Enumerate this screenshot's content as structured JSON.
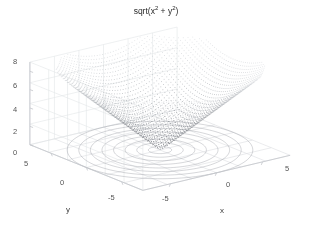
{
  "figure": {
    "width": 312,
    "height": 230,
    "background": "#ffffff",
    "title_plain": "sqrt(x^2 + y^2)"
  },
  "title": {
    "prefix": "sqrt(x",
    "sup1": "2",
    "middle": " + y",
    "sup2": "2",
    "suffix": ")"
  },
  "axes": {
    "x_title": "x",
    "y_title": "y",
    "z_ticks": [
      "8",
      "6",
      "4",
      "2",
      "0"
    ],
    "x_ticks": [
      "-5",
      "0",
      "5"
    ],
    "y_ticks": [
      "-5",
      "0",
      "5"
    ]
  },
  "tick_positions": {
    "z": [
      {
        "label": "8",
        "x": 17,
        "y": 61
      },
      {
        "label": "6",
        "x": 17,
        "y": 85
      },
      {
        "label": "4",
        "x": 17,
        "y": 109
      },
      {
        "label": "2",
        "x": 17,
        "y": 131
      },
      {
        "label": "0",
        "x": 17,
        "y": 152
      }
    ],
    "y_side": [
      {
        "label": "5",
        "x": 27,
        "y": 163
      },
      {
        "label": "0",
        "x": 63,
        "y": 182
      },
      {
        "label": "-5",
        "x": 113,
        "y": 197
      }
    ],
    "x_side": [
      {
        "label": "-5",
        "x": 166,
        "y": 198
      },
      {
        "label": "0",
        "x": 229,
        "y": 184
      },
      {
        "label": "5",
        "x": 288,
        "y": 168
      }
    ]
  },
  "axis_title_positions": {
    "y": {
      "x": 68,
      "y": 211
    },
    "x": {
      "x": 222,
      "y": 212
    }
  },
  "colors": {
    "background": "#ffffff",
    "surface_dots": "#9aa0a8",
    "surface_dots_dark": "#5d636b",
    "contour": "#8a8f97",
    "grid": "#dcdee1",
    "axis_line": "#c4c7cb",
    "tick_text": "#555555",
    "title_text": "#2a2a2a"
  },
  "chart_data": {
    "type": "scatter",
    "xlabel": "x",
    "ylabel": "y",
    "zlabel": "",
    "function": "z = sqrt(x^2 + y^2)",
    "projection": "3d",
    "render_style": "dot-mesh surface with base contour projection",
    "xlim": [
      -8,
      8
    ],
    "ylim": [
      -8,
      8
    ],
    "zlim": [
      0,
      9
    ],
    "grid": true,
    "legend": null,
    "xtick_labels": [
      "-5",
      "0",
      "5"
    ],
    "ytick_labels": [
      "-5",
      "0",
      "5"
    ],
    "ztick_labels": [
      "0",
      "2",
      "4",
      "6",
      "8"
    ],
    "xticks": [
      -5,
      0,
      5
    ],
    "yticks": [
      -5,
      0,
      5
    ],
    "zticks": [
      0,
      2,
      4,
      6,
      8
    ],
    "view_azimuth_deg": -37.5,
    "view_elevation_deg": 30,
    "surface_samples": 55,
    "contour_levels": [
      1,
      2,
      3,
      4,
      5,
      6,
      7,
      8
    ],
    "z_min": 0,
    "z_max": 8.49,
    "annotations": []
  }
}
